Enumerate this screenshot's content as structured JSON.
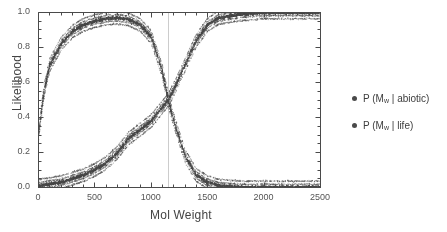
{
  "chart_data": {
    "type": "scatter",
    "title": "",
    "xlabel": "Mol Weight",
    "ylabel": "Likelihood",
    "xlim": [
      0,
      2500
    ],
    "ylim": [
      0.0,
      1.0
    ],
    "xticks": [
      0,
      500,
      1000,
      1500,
      2000,
      2500
    ],
    "xtick_labels": [
      "0",
      "500",
      "1000",
      "1500",
      "2000",
      "2500"
    ],
    "yticks": [
      0.0,
      0.2,
      0.4,
      0.6,
      0.8,
      1.0
    ],
    "ytick_labels": [
      "0.0",
      "0.2",
      "0.4",
      "0.6",
      "0.8",
      "1.0"
    ],
    "x_minor_tick_step": 100,
    "y_minor_tick_step": 0.05,
    "grid": false,
    "vertical_reference_line_x": 1150,
    "crossover_point": {
      "x": 1150,
      "y": 0.5
    },
    "legend_position": "right-outside",
    "marker_color": "#4a4a4a",
    "axis_color": "#4a4a4a",
    "background_color": "#ffffff",
    "series": [
      {
        "name": "P (Mw | abiotic)",
        "label_main": "P (M",
        "label_sub": "w",
        "label_tail": " | abiotic)",
        "shape": "rising-sigmoid",
        "color": "#4a4a4a",
        "midpoint_x": 1150,
        "steepness": 0.0052,
        "x": [
          0,
          100,
          200,
          300,
          400,
          500,
          600,
          700,
          800,
          900,
          1000,
          1100,
          1150,
          1200,
          1300,
          1400,
          1500,
          1600,
          1800,
          2000,
          2200,
          2400,
          2500
        ],
        "values": [
          0.01,
          0.02,
          0.03,
          0.05,
          0.07,
          0.1,
          0.14,
          0.2,
          0.28,
          0.33,
          0.38,
          0.46,
          0.5,
          0.56,
          0.7,
          0.84,
          0.93,
          0.97,
          0.99,
          1.0,
          1.0,
          1.0,
          1.0
        ]
      },
      {
        "name": "P (Mw | life)",
        "label_main": "P (M",
        "label_sub": "w",
        "label_tail": " | life)",
        "shape": "rise-then-fall",
        "color": "#4a4a4a",
        "peak_x": 700,
        "peak_y": 0.97,
        "midpoint_x": 1150,
        "x": [
          0,
          50,
          100,
          200,
          300,
          400,
          500,
          600,
          700,
          800,
          900,
          1000,
          1100,
          1150,
          1200,
          1300,
          1400,
          1500,
          1600,
          1800,
          2000,
          2500
        ],
        "values": [
          0.3,
          0.55,
          0.7,
          0.82,
          0.89,
          0.93,
          0.95,
          0.965,
          0.97,
          0.96,
          0.93,
          0.86,
          0.66,
          0.5,
          0.38,
          0.18,
          0.07,
          0.03,
          0.01,
          0.0,
          0.0,
          0.0
        ]
      }
    ],
    "annotations": [
      {
        "text": "dense point scatter around both curve branches"
      },
      {
        "text": "secondary curve crossing near left axis around x = 60"
      }
    ]
  },
  "legend": {
    "items": [
      {
        "main": "P (M",
        "sub": "w",
        "tail": " | abiotic)"
      },
      {
        "main": "P (M",
        "sub": "w",
        "tail": " | life)"
      }
    ]
  }
}
